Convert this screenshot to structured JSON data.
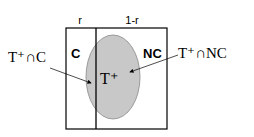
{
  "diagram": {
    "top_labels": {
      "left": "r",
      "right": "1-r"
    },
    "regions": {
      "left": "C",
      "right": "NC"
    },
    "ellipse_label": "T⁺",
    "annotations": {
      "left": "T⁺∩C",
      "right": "T⁺∩NC"
    },
    "colors": {
      "ellipse_fill": "#c8c8c8",
      "stroke": "#000000",
      "background": "#ffffff"
    }
  }
}
